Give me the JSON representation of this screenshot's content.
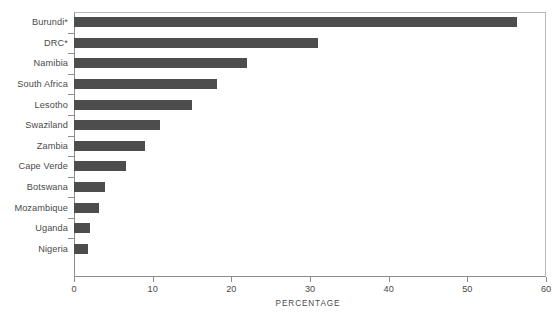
{
  "chart_data": {
    "type": "bar",
    "orientation": "horizontal",
    "title": "",
    "xlabel": "PERCENTAGE",
    "ylabel": "",
    "categories": [
      "Burundi*",
      "DRC*",
      "Namibia",
      "South Africa",
      "Lesotho",
      "Swaziland",
      "Zambia",
      "Cape Verde",
      "Botswana",
      "Mozambique",
      "Uganda",
      "Nigeria"
    ],
    "values": [
      56.3,
      31.0,
      22.0,
      18.2,
      15.0,
      10.9,
      9.0,
      6.6,
      4.0,
      3.2,
      2.0,
      1.8
    ],
    "xlim": [
      0,
      60
    ],
    "xticks": [
      0,
      10,
      20,
      30,
      40,
      50,
      60
    ],
    "xtick_labels": [
      "0",
      "10",
      "20",
      "30",
      "40",
      "50",
      "60"
    ],
    "grid": false,
    "legend": false,
    "bar_color": "#4d4d4d",
    "axis_color": "#8c8c8c",
    "text_color": "#4a4a4a"
  }
}
